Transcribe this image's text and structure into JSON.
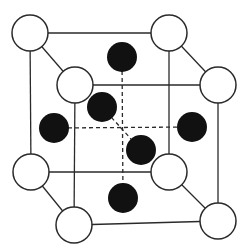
{
  "diagram": {
    "type": "crystal-lattice-unit-cell",
    "colors": {
      "background": "#ffffff",
      "stroke": "#2a2a2a",
      "open_fill": "#ffffff",
      "filled": "#111111"
    },
    "corner_atoms": [
      {
        "id": "back-top-left",
        "x": 30,
        "y": 33
      },
      {
        "id": "back-top-right",
        "x": 169,
        "y": 33
      },
      {
        "id": "back-bottom-left",
        "x": 31,
        "y": 172
      },
      {
        "id": "back-bottom-right",
        "x": 169,
        "y": 172
      },
      {
        "id": "front-top-left",
        "x": 75,
        "y": 85
      },
      {
        "id": "front-top-right",
        "x": 218,
        "y": 85
      },
      {
        "id": "front-bottom-left",
        "x": 74,
        "y": 225
      },
      {
        "id": "front-bottom-right",
        "x": 218,
        "y": 221
      }
    ],
    "corner_radius": 18,
    "face_atoms": [
      {
        "id": "face-top",
        "x": 122,
        "y": 57
      },
      {
        "id": "face-back",
        "x": 102,
        "y": 107
      },
      {
        "id": "face-left",
        "x": 54,
        "y": 128
      },
      {
        "id": "face-right",
        "x": 192,
        "y": 127
      },
      {
        "id": "face-front",
        "x": 141,
        "y": 150
      },
      {
        "id": "face-bottom",
        "x": 123,
        "y": 198
      }
    ],
    "face_radius": 15
  }
}
